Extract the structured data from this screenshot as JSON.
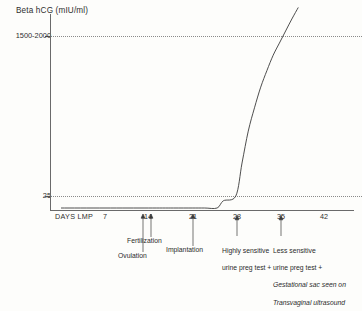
{
  "chart_data": {
    "type": "line",
    "title": "Beta hCG (mIU/ml)",
    "ylabel": "Beta hCG (mIU/ml)",
    "xlabel": "DAYS LMP",
    "grid": true,
    "legend": "none",
    "xlim": [
      0,
      45
    ],
    "ylim": [
      0,
      4000
    ],
    "x_ticks": [
      7,
      14,
      21,
      28,
      35,
      42
    ],
    "x_tick_labels": [
      "7",
      "14",
      "21",
      "28",
      "35",
      "42"
    ],
    "y_ticks": [
      25,
      1750
    ],
    "y_tick_labels": [
      "25",
      "1500-2000"
    ],
    "series": [
      {
        "name": "Beta hCG",
        "x": [
          0,
          7,
          14,
          18,
          21,
          23,
          25,
          26,
          28,
          29,
          30,
          31,
          32,
          33,
          34,
          35,
          36,
          37,
          38
        ],
        "y": [
          0,
          0,
          0,
          2,
          5,
          10,
          18,
          22,
          25,
          60,
          140,
          260,
          450,
          700,
          1050,
          1450,
          2000,
          2750,
          3700
        ]
      }
    ],
    "annotations": [
      {
        "x": 14,
        "label": "Ovulation"
      },
      {
        "x": 14,
        "label": "Fertilization"
      },
      {
        "x": 21,
        "label": "Implantation"
      },
      {
        "x": 28,
        "label": "Highly sensitive\nurine preg test +"
      },
      {
        "x": 35,
        "label": "Less sensitive\nurine preg test +"
      },
      {
        "x": 35,
        "label": "Gestational sac seen on\nTransvaginal ultrasound"
      }
    ]
  },
  "axis": {
    "y_title": "Beta hCG (mIU/ml)",
    "x_name": "DAYS LMP",
    "y_hi_label": "1500-2000",
    "y_lo_label": "25",
    "x_labels": [
      "7",
      "14",
      "21",
      "28",
      "35",
      "42"
    ]
  },
  "annotations": {
    "ovulation": "Ovulation",
    "fertilization": "Fertilization",
    "implantation": "Implantation",
    "highly_sensitive_line1": "Highly sensitive",
    "highly_sensitive_line2": "urine preg test +",
    "less_sensitive_line1": "Less sensitive",
    "less_sensitive_line2": "urine preg test +",
    "less_sensitive_line3": "Gestational sac seen on",
    "less_sensitive_line4": "Transvaginal ultrasound"
  },
  "colors": {
    "background": "#fdfdfb",
    "axis": "#6a6a6a",
    "grid": "#777777",
    "curve": "#3a3a3a",
    "text": "#2b2b2b"
  }
}
